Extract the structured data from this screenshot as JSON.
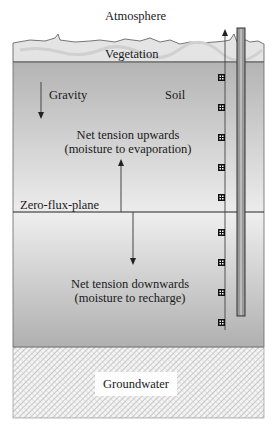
{
  "diagram": {
    "type": "soil-moisture-profile",
    "labels": {
      "atmosphere": "Atmosphere",
      "vegetation": "Vegetation",
      "gravity": "Gravity",
      "soil": "Soil",
      "upward_line1": "Net tension upwards",
      "upward_line2": "(moisture to evaporation)",
      "zero_flux": "Zero-flux-plane",
      "downward_line1": "Net tension downwards",
      "downward_line2": "(moisture to recharge)",
      "groundwater": "Groundwater"
    },
    "layers": [
      {
        "name": "Vegetation",
        "color": "#e2e2e2"
      },
      {
        "name": "Soil (upper zone)",
        "color": "#bdbdbd"
      },
      {
        "name": "Soil (lower zone)",
        "color": "#c4c4c4"
      },
      {
        "name": "Groundwater",
        "pattern": "crosshatch"
      }
    ],
    "arrows": [
      {
        "name": "gravity",
        "direction": "down"
      },
      {
        "name": "net-tension-upwards",
        "direction": "up"
      },
      {
        "name": "net-tension-downwards",
        "direction": "down"
      },
      {
        "name": "sensor-column-upward",
        "direction": "up"
      }
    ],
    "sensors": {
      "count": 10
    },
    "access_tube": {
      "present": true
    }
  }
}
